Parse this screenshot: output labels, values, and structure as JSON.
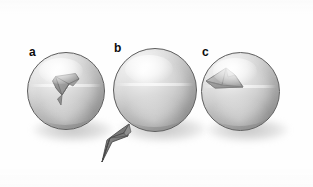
{
  "figure": {
    "background_color": "#ffffff",
    "sphere_color": "#c3c3c3",
    "outline_color": "#5e5e5e",
    "shadow_color": "#8c8c8c",
    "flake_color": "#8f8f8f",
    "fragment_color": "#6e6e6e"
  },
  "panels": [
    {
      "id": "a",
      "label": "a",
      "label_x": 29,
      "label_y": 48,
      "sphere": {
        "x": 27,
        "y": 52,
        "size": 78
      },
      "shadow": {
        "x": 33,
        "y": 116,
        "w": 80,
        "h": 26
      },
      "feature": "attached-angular-flake-on-surface",
      "feature_note": "dark wedge-shaped flake still seated in sphere surface, upper-centre"
    },
    {
      "id": "b",
      "label": "b",
      "label_x": 114,
      "label_y": 44,
      "sphere": {
        "x": 113,
        "y": 48,
        "size": 84
      },
      "shadow": {
        "x": 119,
        "y": 114,
        "w": 86,
        "h": 28
      },
      "feature": "detached-fragment-below-left",
      "feature_note": "smooth sphere; dark arrowhead fragment separated at lower-left"
    },
    {
      "id": "c",
      "label": "c",
      "label_x": 202,
      "label_y": 48,
      "sphere": {
        "x": 201,
        "y": 52,
        "size": 79
      },
      "shadow": {
        "x": 207,
        "y": 116,
        "w": 81,
        "h": 26
      },
      "feature": "spall-crater-upper-left",
      "feature_note": "light angular spall scar / crater on upper-left of sphere"
    }
  ],
  "fragment": {
    "name": "detached-fragment",
    "x": 100,
    "y": 124,
    "w": 42,
    "h": 40
  }
}
